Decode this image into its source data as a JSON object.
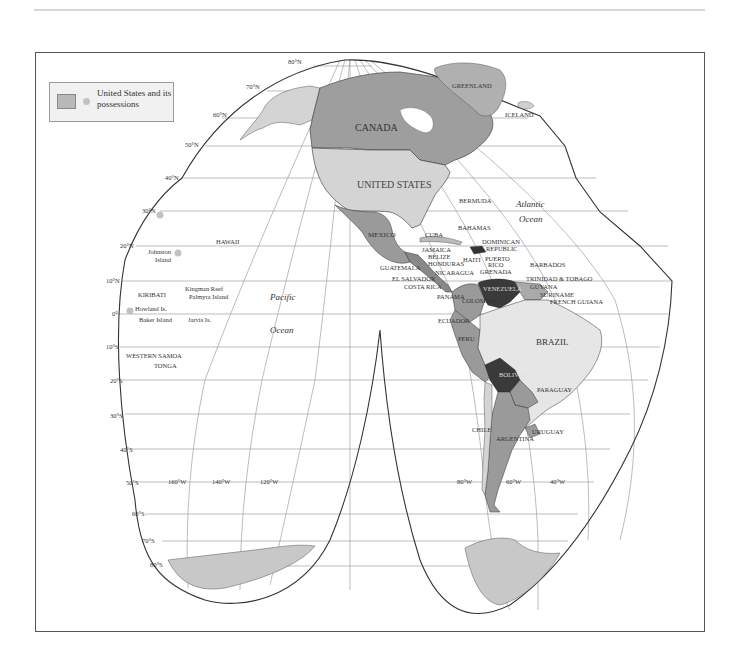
{
  "legend": {
    "text": "United States and its possessions",
    "swatch_color": "#b9b9b9",
    "dot_color": "#c2c2c2"
  },
  "colors": {
    "us_fill": "#d4d4d4",
    "canada_fill": "#9e9e9e",
    "medium_fill": "#9a9a9a",
    "dark_fill": "#3a3a3a",
    "light_fill": "#e6e6e6",
    "antarctica_fill": "#c8c8c8",
    "graticule": "#9a9a9a",
    "outline": "#333333"
  },
  "latitude_labels": {
    "n80": "80°N",
    "n70": "70°N",
    "n60": "60°N",
    "n50": "50°N",
    "n40": "40°N",
    "n30": "30°N",
    "n20": "20°N",
    "n10": "10°N",
    "eq": "0°",
    "s10": "10°S",
    "s20": "20°S",
    "s30": "30°S",
    "s40": "40°S",
    "s50": "50°S",
    "s60": "60°S",
    "s70": "70°S",
    "s80": "80°S"
  },
  "longitude_labels": {
    "w160": "160°W",
    "w140": "140°W",
    "w120": "120°W",
    "w80": "80°W",
    "w60": "60°W",
    "w40": "40°W"
  },
  "oceans": {
    "pacific_1": "Pacific",
    "pacific_2": "Ocean",
    "atlantic_1": "Atlantic",
    "atlantic_2": "Ocean"
  },
  "countries": {
    "canada": "CANADA",
    "united_states": "UNITED STATES",
    "greenland": "GREENLAND",
    "iceland": "ICELAND",
    "mexico": "MEXICO",
    "bermuda": "BERMUDA",
    "bahamas": "BAHAMAS",
    "cuba": "CUBA",
    "dominican_1": "DOMINICAN",
    "dominican_2": "REPUBLIC",
    "jamaica": "JAMAICA",
    "belize": "BELIZE",
    "honduras": "HONDURAS",
    "haiti": "HAITI",
    "puerto_1": "PUERTO",
    "puerto_2": "RICO",
    "barbados": "BARBADOS",
    "guatemala": "GUATEMALA",
    "nicaragua": "NICARAGUA",
    "grenada": "GRENADA",
    "trinidad": "TRINIDAD & TOBAGO",
    "el_salvador": "EL SALVADOR",
    "costa_rica": "COSTA RICA",
    "venezuela": "VENEZUELA",
    "guyana": "GUYANA",
    "suriname": "SURINAME",
    "french_guiana": "FRENCH GUIANA",
    "panama": "PANAMA",
    "colombia": "COLOMBIA",
    "ecuador": "ECUADOR",
    "peru": "PERU",
    "brazil": "BRAZIL",
    "bolivia": "BOLIVIA",
    "paraguay": "PARAGUAY",
    "chile": "CHILE",
    "argentina": "ARGENTINA",
    "uruguay": "URUGUAY"
  },
  "islands": {
    "hawaii": "HAWAII",
    "johnston_1": "Johnston",
    "johnston_2": "Island",
    "kingman": "Kingman Reef",
    "palmyra": "Palmyra Island",
    "kiribati": "KIRIBATI",
    "howland": "Howland Is.",
    "baker": "Baker Island",
    "jarvis": "Jarvis Is.",
    "western_samoa": "WESTERN SAMOA",
    "tonga": "TONGA"
  }
}
